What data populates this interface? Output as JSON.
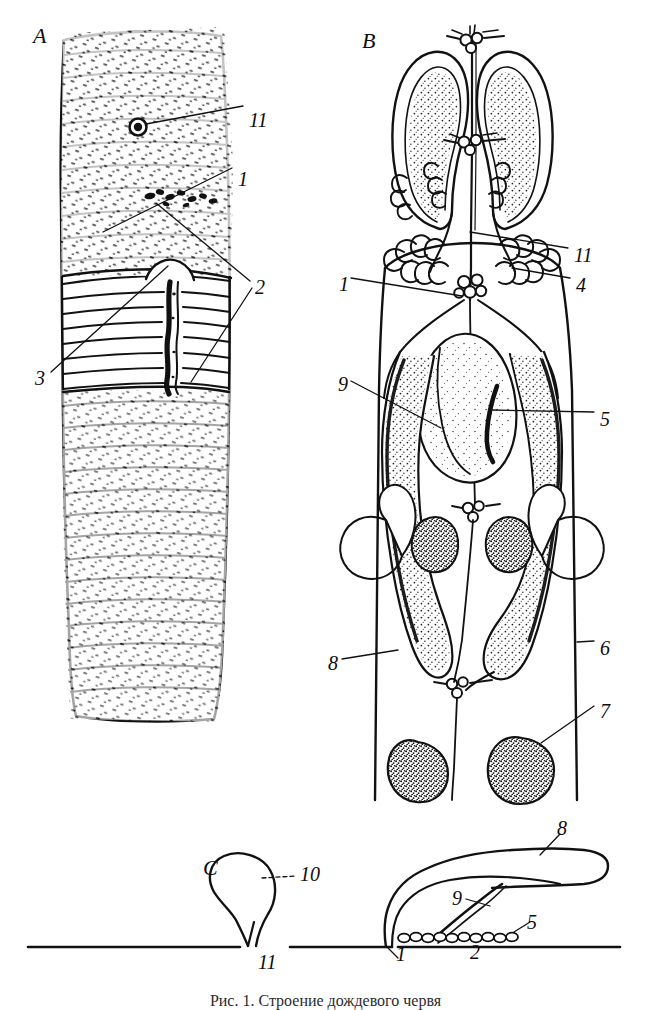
{
  "figure": {
    "background_color": "#ffffff",
    "ink_color": "#111111",
    "caption": "Рис. 1. Строение дождевого червя"
  },
  "panels": [
    {
      "id": "A",
      "letter": "A",
      "name": "external-view",
      "description": "External view of the anterior body showing segments, clitellum and male pore"
    },
    {
      "id": "B",
      "letter": "B",
      "name": "internal-reproductive-organs",
      "description": "Internal reproductive organs: seminal vesicles, ovaries, spermathecae"
    },
    {
      "id": "C",
      "letter": "C",
      "name": "schematic-section",
      "description": "Schematic sagittal section through the body wall"
    }
  ],
  "labels": {
    "panel_a": [
      {
        "id": "a-11",
        "text": "11",
        "x": 249,
        "y": 110
      },
      {
        "id": "a-1",
        "text": "1",
        "x": 238,
        "y": 169
      },
      {
        "id": "a-2",
        "text": "2",
        "x": 255,
        "y": 277
      },
      {
        "id": "a-3",
        "text": "3",
        "x": 35,
        "y": 368
      }
    ],
    "panel_b": [
      {
        "id": "b-11",
        "text": "11",
        "x": 574,
        "y": 245
      },
      {
        "id": "b-4",
        "text": "4",
        "x": 576,
        "y": 275
      },
      {
        "id": "b-1",
        "text": "1",
        "x": 339,
        "y": 274
      },
      {
        "id": "b-9",
        "text": "9",
        "x": 338,
        "y": 374
      },
      {
        "id": "b-5",
        "text": "5",
        "x": 600,
        "y": 409
      },
      {
        "id": "b-8",
        "text": "8",
        "x": 328,
        "y": 653
      },
      {
        "id": "b-6",
        "text": "6",
        "x": 600,
        "y": 638
      },
      {
        "id": "b-7",
        "text": "7",
        "x": 600,
        "y": 701
      }
    ],
    "panel_c": [
      {
        "id": "c-10",
        "text": "10",
        "x": 300,
        "y": 874
      },
      {
        "id": "c-11",
        "text": "11",
        "x": 258,
        "y": 954
      },
      {
        "id": "c-8",
        "text": "8",
        "x": 557,
        "y": 820
      },
      {
        "id": "c-9",
        "text": "9",
        "x": 452,
        "y": 890
      },
      {
        "id": "c-5",
        "text": "5",
        "x": 527,
        "y": 915
      },
      {
        "id": "c-1",
        "text": "1",
        "x": 396,
        "y": 946
      },
      {
        "id": "c-2",
        "text": "2",
        "x": 470,
        "y": 944
      }
    ]
  },
  "panel_letters": [
    {
      "id": "letter-a",
      "text": "A",
      "x": 33,
      "y": 25
    },
    {
      "id": "letter-b",
      "text": "B",
      "x": 362,
      "y": 30
    },
    {
      "id": "letter-c",
      "text": "C",
      "x": 203,
      "y": 857
    }
  ]
}
